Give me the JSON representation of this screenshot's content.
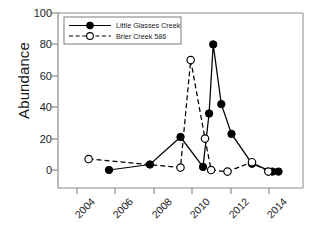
{
  "chart_data": {
    "type": "line",
    "title": "",
    "xlabel": "",
    "ylabel": "Abundance",
    "xlim": [
      2003.0,
      2015.0
    ],
    "ylim": [
      0,
      100
    ],
    "yticks": [
      0,
      20,
      40,
      60,
      80,
      100
    ],
    "xticks": [
      2004,
      2006,
      2008,
      2010,
      2012,
      2014
    ],
    "grid": false,
    "legend_position": "top-left inside axes",
    "series": [
      {
        "name": "Little Glasses Creek",
        "marker": "filled-circle",
        "linestyle": "solid",
        "color": "#000000",
        "points": [
          {
            "x": 2005.5,
            "y": 0
          },
          {
            "x": 2007.5,
            "y": 3.5
          },
          {
            "x": 2009.0,
            "y": 21
          },
          {
            "x": 2010.1,
            "y": 2
          },
          {
            "x": 2010.4,
            "y": 36
          },
          {
            "x": 2010.6,
            "y": 80
          },
          {
            "x": 2011.0,
            "y": 42
          },
          {
            "x": 2011.5,
            "y": 23
          },
          {
            "x": 2012.5,
            "y": 4
          },
          {
            "x": 2013.5,
            "y": -1
          },
          {
            "x": 2013.8,
            "y": -1
          }
        ]
      },
      {
        "name": "Brier Creek 586",
        "marker": "open-circle",
        "linestyle": "dashed",
        "color": "#000000",
        "points": [
          {
            "x": 2004.5,
            "y": 7
          },
          {
            "x": 2009.0,
            "y": 1.5
          },
          {
            "x": 2009.5,
            "y": 70
          },
          {
            "x": 2010.2,
            "y": 20
          },
          {
            "x": 2010.5,
            "y": 0
          },
          {
            "x": 2011.3,
            "y": -1
          },
          {
            "x": 2012.5,
            "y": 5
          },
          {
            "x": 2013.3,
            "y": -1
          }
        ]
      }
    ]
  },
  "axis": {
    "ylabel": "Abundance",
    "ytick_labels": [
      "100",
      "80",
      "60",
      "40",
      "20",
      "0"
    ],
    "xtick_labels": [
      "2004",
      "2006",
      "2008",
      "2010",
      "2012",
      "2014"
    ]
  },
  "legend": {
    "items": [
      {
        "label": "Little Glasses Creek",
        "marker": "filled-circle",
        "linestyle": "solid"
      },
      {
        "label": "Brier Creek 586",
        "marker": "open-circle",
        "linestyle": "dashed"
      }
    ]
  },
  "colors": {
    "axis": "#8a8a8a",
    "ink": "#1a1a1a",
    "series": "#000000",
    "background": "#ffffff"
  }
}
